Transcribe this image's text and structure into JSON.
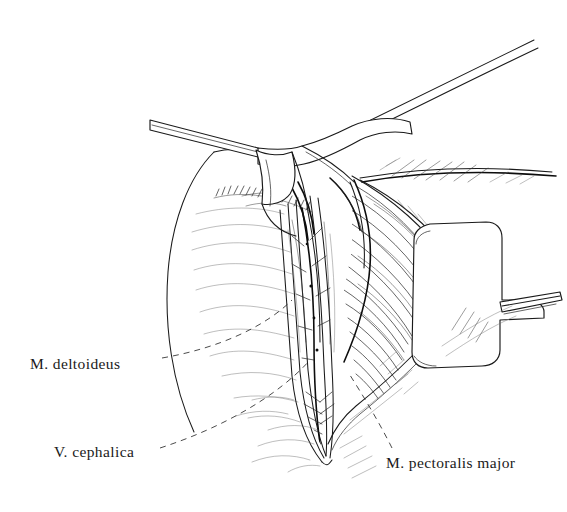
{
  "figure": {
    "background_color": "#ffffff",
    "ink_color": "#1a1a1a",
    "width": 567,
    "height": 512,
    "style": "pen-and-ink line drawing with hatching"
  },
  "labels": [
    {
      "id": "deltoideus",
      "text": "M. deltoideus",
      "structure": "deltoid muscle",
      "leader": "dashed",
      "x": 30,
      "y": 356
    },
    {
      "id": "cephalica",
      "text": "V. cephalica",
      "structure": "cephalic vein",
      "leader": "dashed",
      "x": 54,
      "y": 444
    },
    {
      "id": "pectoralis",
      "text": "M. pectoralis major",
      "structure": "pectoralis major muscle",
      "leader": "dashed",
      "x": 386,
      "y": 455
    }
  ],
  "anatomy": {
    "retractors": [
      {
        "name": "upper-left-retractor",
        "description": "blade with angled handle toward upper left"
      },
      {
        "name": "right-retractor",
        "description": "rounded rectangular blade with handle toward right"
      }
    ],
    "regions": [
      {
        "name": "deltoid-muscle-belly",
        "description": "large smooth contour on left of wound"
      },
      {
        "name": "pectoralis-major-muscle",
        "description": "hatched fibrous mass right of the wound"
      },
      {
        "name": "deltopectoral-groove",
        "description": "dark interval containing the cephalic vein"
      },
      {
        "name": "clavicle-shoulder-contour",
        "description": "long sweeping line across upper right"
      },
      {
        "name": "surgical-wound",
        "description": "V-shaped opened incision converging inferiorly"
      }
    ]
  }
}
